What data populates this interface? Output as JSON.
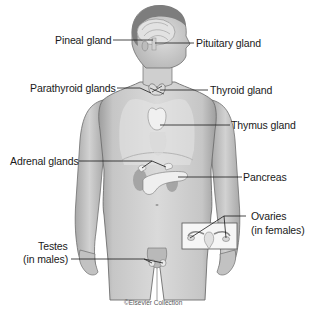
{
  "diagram": {
    "labels": {
      "pineal": "Pineal gland",
      "pituitary": "Pituitary gland",
      "parathyroid": "Parathyroid glands",
      "thyroid": "Thyroid gland",
      "thymus": "Thymus gland",
      "adrenal": "Adrenal glands",
      "pancreas": "Pancreas",
      "ovaries_line1": "Ovaries",
      "ovaries_line2": "(in females)",
      "testes_line1": "Testes",
      "testes_line2": "(in males)"
    },
    "credit": "©Elsevier Collection",
    "colors": {
      "background": "#ffffff",
      "skin": "#cfcfcf",
      "skin_shadow": "#a9a9a9",
      "outline": "#6e6e6e",
      "hair": "#7d7d7d",
      "organ": "#e4e4e4",
      "kidney": "#9a9a9a",
      "leader_line": "#1a1a1a",
      "text": "#1a1a1a"
    }
  }
}
